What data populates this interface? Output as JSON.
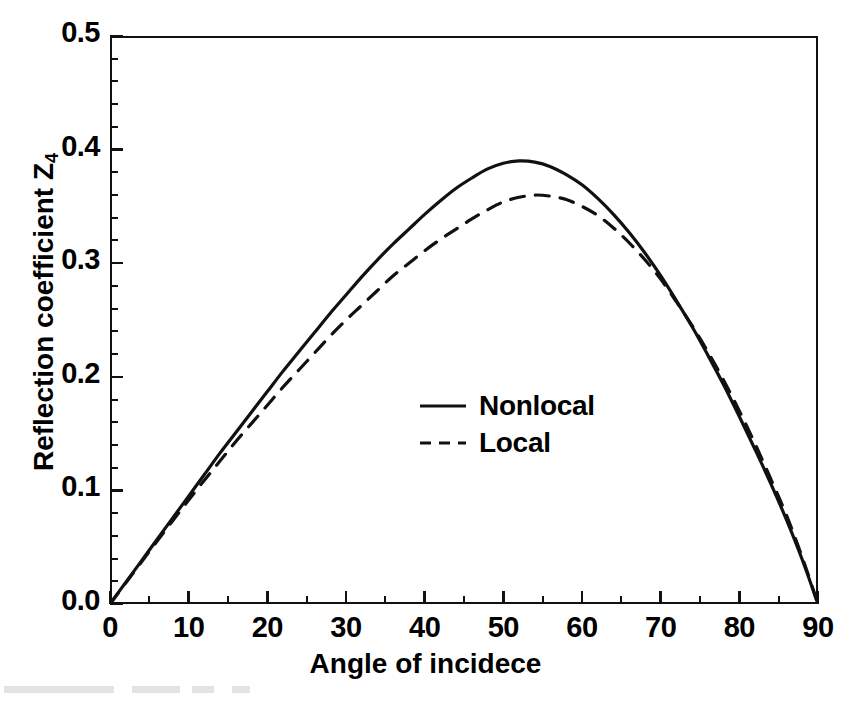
{
  "chart_data": {
    "type": "line",
    "title": "",
    "subtitle": "",
    "xlabel": "Angle of incidece",
    "ylabel": "Reflection coefficient Z",
    "ylabel_sub": "4",
    "xlim": [
      0,
      90
    ],
    "ylim": [
      0.0,
      0.5
    ],
    "xticks": [
      0,
      10,
      20,
      30,
      40,
      50,
      60,
      70,
      80,
      90
    ],
    "xticklabels": [
      "0",
      "10",
      "20",
      "30",
      "40",
      "50",
      "60",
      "70",
      "80",
      "90"
    ],
    "yticks": [
      0.0,
      0.1,
      0.2,
      0.3,
      0.4,
      0.5
    ],
    "yticklabels": [
      "0.0",
      "0.1",
      "0.2",
      "0.3",
      "0.4",
      "0.5"
    ],
    "x_minor_tick_interval": 5,
    "y_minor_tick_interval": 0.02,
    "grid": false,
    "legend_position": "center",
    "series": [
      {
        "name": "Nonlocal",
        "style": "solid",
        "color": "#111111",
        "x": [
          0,
          2,
          4,
          6,
          8,
          10,
          12,
          14,
          16,
          18,
          20,
          22,
          24,
          26,
          28,
          30,
          32,
          34,
          36,
          38,
          40,
          42,
          44,
          46,
          48,
          50,
          52,
          54,
          56,
          58,
          60,
          62,
          64,
          66,
          68,
          70,
          72,
          74,
          76,
          78,
          80,
          82,
          84,
          86,
          88,
          90
        ],
        "y": [
          0.0,
          0.019,
          0.038,
          0.057,
          0.076,
          0.095,
          0.114,
          0.133,
          0.151,
          0.169,
          0.187,
          0.205,
          0.222,
          0.239,
          0.256,
          0.272,
          0.288,
          0.303,
          0.317,
          0.33,
          0.343,
          0.355,
          0.366,
          0.375,
          0.383,
          0.388,
          0.39,
          0.389,
          0.385,
          0.378,
          0.369,
          0.357,
          0.343,
          0.327,
          0.309,
          0.289,
          0.267,
          0.244,
          0.219,
          0.193,
          0.165,
          0.136,
          0.106,
          0.074,
          0.039,
          0.0
        ]
      },
      {
        "name": "Local",
        "style": "dashed",
        "color": "#111111",
        "x": [
          0,
          2,
          4,
          6,
          8,
          10,
          12,
          14,
          16,
          18,
          20,
          22,
          24,
          26,
          28,
          30,
          32,
          34,
          36,
          38,
          40,
          42,
          44,
          46,
          48,
          50,
          52,
          54,
          56,
          58,
          60,
          62,
          64,
          66,
          68,
          70,
          72,
          74,
          76,
          78,
          80,
          82,
          84,
          86,
          88,
          90
        ],
        "y": [
          0.0,
          0.0185,
          0.037,
          0.0555,
          0.0735,
          0.0915,
          0.109,
          0.126,
          0.143,
          0.159,
          0.175,
          0.191,
          0.206,
          0.221,
          0.236,
          0.25,
          0.263,
          0.276,
          0.289,
          0.3,
          0.311,
          0.321,
          0.33,
          0.339,
          0.347,
          0.354,
          0.358,
          0.36,
          0.359,
          0.356,
          0.35,
          0.342,
          0.331,
          0.318,
          0.303,
          0.286,
          0.266,
          0.245,
          0.222,
          0.197,
          0.17,
          0.141,
          0.11,
          0.078,
          0.041,
          0.0
        ]
      }
    ]
  },
  "legend": {
    "items": [
      {
        "label": "Nonlocal",
        "style": "solid"
      },
      {
        "label": "Local",
        "style": "dashed"
      }
    ]
  }
}
